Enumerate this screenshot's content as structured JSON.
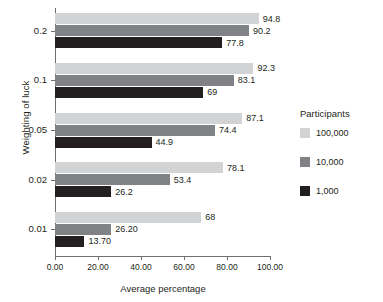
{
  "chart_data": {
    "type": "bar",
    "orientation": "horizontal",
    "title": "",
    "xlabel": "Average percentage",
    "ylabel": "Weighting of luck",
    "xlim": [
      0,
      100
    ],
    "xticks": [
      "0.00",
      "20.00",
      "40.00",
      "60.00",
      "80.00",
      "100.00"
    ],
    "xtick_values": [
      0,
      20,
      40,
      60,
      80,
      100
    ],
    "grid": false,
    "legend": {
      "title": "Participants",
      "position": "right"
    },
    "categories": [
      "0.2",
      "0.1",
      "0.05",
      "0.02",
      "0.01"
    ],
    "series": [
      {
        "name": "100,000",
        "color": "#d2d3d5",
        "values": [
          94.8,
          92.3,
          87.1,
          78.1,
          68
        ],
        "labels": [
          "94.8",
          "92.3",
          "87.1",
          "78.1",
          "68"
        ]
      },
      {
        "name": "10,000",
        "color": "#808285",
        "values": [
          90.2,
          83.1,
          74.4,
          53.4,
          26.2
        ],
        "labels": [
          "90.2",
          "83.1",
          "74.4",
          "53.4",
          "26.20"
        ]
      },
      {
        "name": "1,000",
        "color": "#231f20",
        "values": [
          77.8,
          69,
          44.9,
          26.2,
          13.7
        ],
        "labels": [
          "77.8",
          "69",
          "44.9",
          "26.2",
          "13.70"
        ]
      }
    ]
  }
}
